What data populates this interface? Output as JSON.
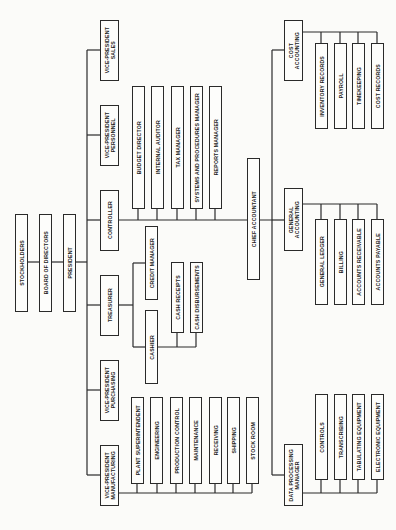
{
  "chart": {
    "orientation": "rotated-90-ccw",
    "top": {
      "stockholders": "STOCKHOLDERS",
      "board": "BOARD OF DIRECTORS",
      "president": "PRESIDENT"
    },
    "officers": {
      "vp_sales": "VICE-PRESIDENT\nSALES",
      "vp_personnel": "VICE-PRESIDENT\nPERSONNEL",
      "controller": "CONTROLLER",
      "treasurer": "TREASURER",
      "vp_purchasing": "VICE-PRESIDENT\nPURCHASING",
      "vp_manufacturing": "VICE-PRESIDENT\nMANUFACTURING"
    },
    "controller_staff": [
      "BUDGET DIRECTOR",
      "INTERNAL AUDITOR",
      "TAX MANAGER",
      "SYSTEMS AND PROCEDURES MANAGER",
      "REPORTS MANAGER"
    ],
    "chief_accountant": "CHIEF ACCOUNTANT",
    "treasurer_staff": {
      "credit_manager": "CREDIT MANAGER",
      "cashier": "CASHIER",
      "cash_receipts": "CASH RECEIPTS",
      "cash_disbursements": "CASH DISBURSEMENTS"
    },
    "manufacturing_staff": [
      "PLANT SUPERINTENDENT",
      "ENGINEERING",
      "PRODUCTION CONTROL",
      "MAINTENANCE",
      "RECEIVING",
      "SHIPPING",
      "STOCK ROOM"
    ],
    "accounting_units": {
      "cost": {
        "title": "COST\nACCOUNTING",
        "staff": [
          "INVENTORY RECORDS",
          "PAYROLL",
          "TIMEKEEPING",
          "COST RECORDS"
        ]
      },
      "general": {
        "title": "GENERAL\nACCOUNTING",
        "staff": [
          "GENERAL LEDGER",
          "BILLING",
          "ACCOUNTS RECEIVABLE",
          "ACCOUNTS PAYABLE"
        ]
      },
      "data_processing": {
        "title": "DATA PROCESSING\nMANAGER",
        "staff": [
          "CONTROLS",
          "TRANSCRIBING",
          "TABULATING EQUIPMENT",
          "ELECTRONIC EQUIPMENT"
        ]
      }
    },
    "colors": {
      "line": "#2a2a2a",
      "background": "#fbfbf9"
    }
  }
}
